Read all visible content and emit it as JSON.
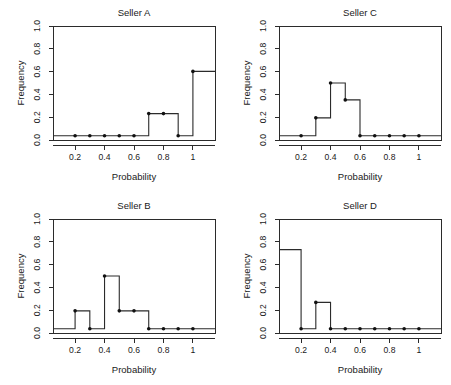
{
  "figure": {
    "background_color": "#ffffff",
    "line_color": "#2b2b2b",
    "dot_color": "#111111",
    "panel_count": 4,
    "layout": "2x2 grid"
  },
  "chart_data": [
    {
      "type": "line",
      "title": "Seller A",
      "xlabel": "Probability",
      "ylabel": "Frequency",
      "xlim": [
        0.05,
        1.15
      ],
      "ylim": [
        -0.04,
        1.04
      ],
      "xticks": [
        0.2,
        0.4,
        0.6,
        0.8,
        1.0
      ],
      "xticklabels": [
        "0.2",
        "0.4",
        "0.6",
        "0.8",
        "1"
      ],
      "yticks": [
        0.0,
        0.2,
        0.4,
        0.6,
        0.8,
        1.0
      ],
      "yticklabels": [
        "0.0",
        "0.2",
        "0.4",
        "0.6",
        "0.8",
        "1.0"
      ],
      "grid": false,
      "legend": "none",
      "style": "step histogram with point markers",
      "x": [
        0.2,
        0.3,
        0.4,
        0.5,
        0.6,
        0.7,
        0.8,
        0.9,
        1.0
      ],
      "values": [
        0.0,
        0.0,
        0.0,
        0.0,
        0.0,
        0.21,
        0.21,
        0.0,
        0.61
      ]
    },
    {
      "type": "line",
      "title": "Seller C",
      "xlabel": "Probability",
      "ylabel": "Frequency",
      "xlim": [
        0.05,
        1.15
      ],
      "ylim": [
        -0.04,
        1.04
      ],
      "xticks": [
        0.2,
        0.4,
        0.6,
        0.8,
        1.0
      ],
      "xticklabels": [
        "0.2",
        "0.4",
        "0.6",
        "0.8",
        "1"
      ],
      "yticks": [
        0.0,
        0.2,
        0.4,
        0.6,
        0.8,
        1.0
      ],
      "yticklabels": [
        "0.0",
        "0.2",
        "0.4",
        "0.6",
        "0.8",
        "1.0"
      ],
      "grid": false,
      "legend": "none",
      "style": "step histogram with point markers",
      "x": [
        0.2,
        0.3,
        0.4,
        0.5,
        0.6,
        0.7,
        0.8,
        0.9,
        1.0
      ],
      "values": [
        0.0,
        0.17,
        0.5,
        0.34,
        0.0,
        0.0,
        0.0,
        0.0,
        0.0
      ]
    },
    {
      "type": "line",
      "title": "Seller B",
      "xlabel": "Probability",
      "ylabel": "Frequency",
      "xlim": [
        0.05,
        1.15
      ],
      "ylim": [
        -0.04,
        1.04
      ],
      "xticks": [
        0.2,
        0.4,
        0.6,
        0.8,
        1.0
      ],
      "xticklabels": [
        "0.2",
        "0.4",
        "0.6",
        "0.8",
        "1"
      ],
      "yticks": [
        0.0,
        0.2,
        0.4,
        0.6,
        0.8,
        1.0
      ],
      "yticklabels": [
        "0.0",
        "0.2",
        "0.4",
        "0.6",
        "0.8",
        "1.0"
      ],
      "grid": false,
      "legend": "none",
      "style": "step histogram with point markers",
      "x": [
        0.2,
        0.3,
        0.4,
        0.5,
        0.6,
        0.7,
        0.8,
        0.9,
        1.0
      ],
      "values": [
        0.17,
        0.0,
        0.5,
        0.17,
        0.17,
        0.0,
        0.0,
        0.0,
        0.0
      ]
    },
    {
      "type": "line",
      "title": "Seller D",
      "xlabel": "Probability",
      "ylabel": "Frequency",
      "xlim": [
        0.05,
        1.15
      ],
      "ylim": [
        -0.04,
        1.04
      ],
      "xticks": [
        0.2,
        0.4,
        0.6,
        0.8,
        1.0
      ],
      "xticklabels": [
        "0.2",
        "0.4",
        "0.6",
        "0.8",
        "1"
      ],
      "yticks": [
        0.0,
        0.2,
        0.4,
        0.6,
        0.8,
        1.0
      ],
      "yticklabels": [
        "0.0",
        "0.2",
        "0.4",
        "0.6",
        "0.8",
        "1.0"
      ],
      "grid": false,
      "legend": "none",
      "style": "step histogram with point markers",
      "leading_level": 0.75,
      "x": [
        0.2,
        0.3,
        0.4,
        0.5,
        0.6,
        0.7,
        0.8,
        0.9,
        1.0
      ],
      "values": [
        0.0,
        0.25,
        0.0,
        0.0,
        0.0,
        0.0,
        0.0,
        0.0,
        0.0
      ]
    }
  ]
}
